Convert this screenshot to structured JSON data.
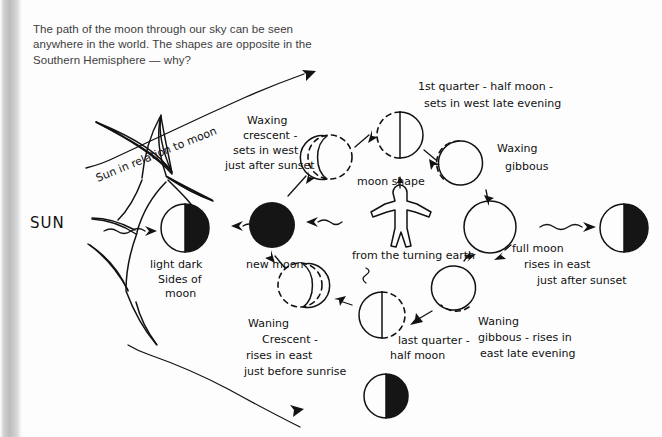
{
  "caption": {
    "text": "The path of the moon through our sky can be seen anywhere in the world. The shapes are opposite in the Southern Hemisphere — why?"
  },
  "diagram": {
    "sun_label": "SUN",
    "sun_relation_label": "Sun in relation to moon",
    "observer_label_above": "moon shape",
    "observer_label_below": "from the turning earth",
    "labels": {
      "light_dark": "light dark\nsides of\nmoon",
      "light_dark_lines": [
        "light dark",
        "Sides of",
        "moon"
      ],
      "new_moon": "new moon",
      "waxing_crescent_lines": [
        "Waxing",
        "crescent -",
        "sets in west",
        "just after sunset"
      ],
      "first_quarter_lines": [
        "1st quarter - half moon -",
        "sets in west late evening"
      ],
      "waxing_gibbous_lines": [
        "Waxing",
        "gibbous"
      ],
      "full_moon_lines": [
        "full moon",
        "rises in east",
        "just after sunset"
      ],
      "waning_gibbous_lines": [
        "Waning",
        "gibbous - rises in",
        "east late evening"
      ],
      "last_quarter_lines": [
        "last quarter -",
        "half moon"
      ],
      "waning_crescent_lines": [
        "Waning",
        "Crescent -",
        "rises in east",
        "just before sunrise"
      ]
    },
    "phases": [
      {
        "name": "light-dark-sides-half-moon",
        "shape": "half-dark-right",
        "x": 185,
        "y": 228
      },
      {
        "name": "new-moon",
        "shape": "full-dark",
        "x": 272,
        "y": 225
      },
      {
        "name": "waxing-crescent",
        "shape": "crescent-right-lit",
        "x": 330,
        "y": 157
      },
      {
        "name": "first-quarter",
        "shape": "half-right-lit",
        "x": 400,
        "y": 135
      },
      {
        "name": "waxing-gibbous",
        "shape": "gibbous-right-lit",
        "x": 465,
        "y": 163
      },
      {
        "name": "full-moon",
        "shape": "full-light",
        "x": 490,
        "y": 227
      },
      {
        "name": "half-moon-right-edge",
        "shape": "half-dark-right",
        "x": 624,
        "y": 228
      },
      {
        "name": "waning-gibbous",
        "shape": "gibbous-left-lit",
        "x": 455,
        "y": 288
      },
      {
        "name": "last-quarter",
        "shape": "half-left-lit",
        "x": 382,
        "y": 315
      },
      {
        "name": "waning-crescent",
        "shape": "crescent-left-lit",
        "x": 300,
        "y": 285
      },
      {
        "name": "half-moon-bottom",
        "shape": "half-dark-right",
        "x": 386,
        "y": 396
      }
    ],
    "colors": {
      "ink": "#121212",
      "paper": "#fdfdfd",
      "caption_text": "#3d3d3d",
      "gutter": "#bdbdbd"
    }
  }
}
